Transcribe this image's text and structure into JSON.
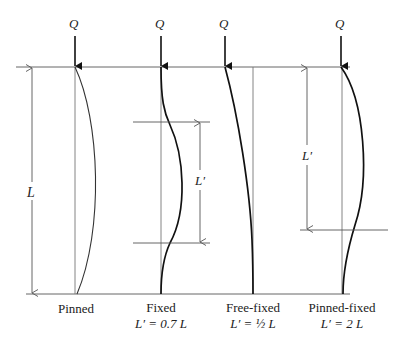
{
  "figure": {
    "load_symbol": "Q",
    "length_symbol": "L",
    "effective_length_symbol": "L′",
    "columns": [
      {
        "id": "pinned",
        "name": "Pinned",
        "formula": ""
      },
      {
        "id": "fixed",
        "name": "Fixed",
        "formula": "L′ = 0.7 L"
      },
      {
        "id": "free-fixed",
        "name": "Free-fixed",
        "formula": "L′ = ½ L"
      },
      {
        "id": "pinned-fixed",
        "name": "Pinned-fixed",
        "formula": "L′ = 2 L"
      }
    ]
  },
  "colors": {
    "line": "#555555",
    "curve": "#111111",
    "text": "#222222"
  }
}
